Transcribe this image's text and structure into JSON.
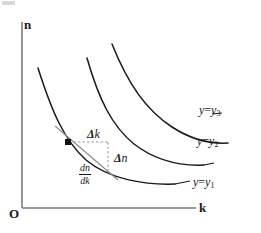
{
  "chart_data": {
    "type": "line",
    "title": "",
    "xlabel": "k",
    "ylabel": "n",
    "origin_label": "O",
    "grid": false,
    "legend_position": "inline-right-of-curves",
    "axis_ranges": {
      "x": [
        0,
        1
      ],
      "y": [
        0,
        1
      ]
    },
    "series": [
      {
        "name": "y=y1",
        "label_main": "y",
        "label_eq": "=",
        "label_sub_var": "y",
        "label_sub_index": "1",
        "path": "M 38 68 C 52 112, 64 140, 86 160 C 110 180, 146 185, 175 184",
        "label_leader": "M 175 184 L 190 181",
        "label_x": 193,
        "label_y": 176
      },
      {
        "name": "y=y2",
        "label_main": "y",
        "label_eq": "=",
        "label_sub_var": "y",
        "label_sub_index": "2",
        "path": "M 87 58 C 99 100, 112 126, 134 144 C 156 161, 182 166, 204 165",
        "label_leader": "M 204 165 L 214 163",
        "label_x": 197,
        "label_y": 135
      },
      {
        "name": "y=y3",
        "label_main": "y",
        "label_eq": "=",
        "label_sub_var": "y",
        "label_sub_index": "3",
        "path": "M 112 44 C 128 84, 146 110, 172 127 C 192 140, 212 144, 228 143",
        "label_leader": "M 212 114 L 222 113",
        "label_x": 199,
        "label_y": 104
      }
    ],
    "annotations": [
      {
        "name": "delta-k",
        "symbol": "Δ",
        "variable": "k",
        "x": 87,
        "y": 128
      },
      {
        "name": "delta-n",
        "symbol": "Δ",
        "variable": "n",
        "x": 114,
        "y": 152
      },
      {
        "name": "derivative",
        "numerator": "dn",
        "denominator": "dk",
        "x": 79,
        "y": 163
      }
    ],
    "tangent_point": {
      "x": 68,
      "y": 142
    },
    "tangent_line": "M 55 126 L 118 180",
    "delta_k_segment": "M 69 142 L 108 142",
    "delta_n_segment": "M 108 142 L 108 171"
  },
  "colors": {
    "axis": "#7c7c7c",
    "curve": "#1a1a1a",
    "tangent": "#8a8a8a",
    "dashed": "#9a9a9a",
    "text": "#1a1a1a",
    "background": "#ffffff"
  },
  "axes": {
    "y_axis_label": "n",
    "x_axis_label": "k",
    "origin": "O"
  }
}
